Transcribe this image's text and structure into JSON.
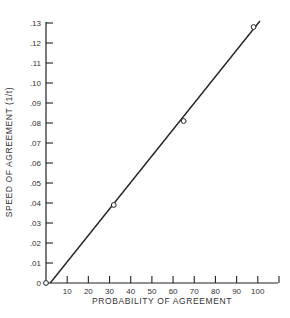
{
  "chart_data": {
    "type": "scatter",
    "title": "",
    "xlabel": "PROBABILITY OF AGREEMENT",
    "ylabel": "SPEED OF AGREEMENT (1/t)",
    "xlim": [
      0,
      110
    ],
    "ylim": [
      0,
      0.13
    ],
    "x_ticks": [
      10,
      20,
      30,
      40,
      50,
      60,
      70,
      80,
      90,
      100,
      110
    ],
    "x_tick_labels": [
      "10",
      "20",
      "30",
      "40",
      "50",
      "60",
      "70",
      "80",
      "90",
      "100",
      ""
    ],
    "y_ticks": [
      0,
      0.01,
      0.02,
      0.03,
      0.04,
      0.05,
      0.06,
      0.07,
      0.08,
      0.09,
      0.1,
      0.11,
      0.12,
      0.13
    ],
    "y_tick_labels": [
      "0",
      ".01",
      ".02",
      ".03",
      ".04",
      ".05",
      ".06",
      ".07",
      ".08",
      ".09",
      ".10",
      ".11",
      ".12",
      ".13"
    ],
    "grid": false,
    "legend": null,
    "series": [
      {
        "name": "observed",
        "marker": "open-circle",
        "points": [
          {
            "x": 0,
            "y": 0
          },
          {
            "x": 32,
            "y": 0.039
          },
          {
            "x": 65,
            "y": 0.081
          },
          {
            "x": 98,
            "y": 0.128
          }
        ]
      },
      {
        "name": "fitted-line",
        "style": "line",
        "points": [
          {
            "x": 2,
            "y": 0
          },
          {
            "x": 101,
            "y": 0.131
          }
        ]
      }
    ]
  }
}
